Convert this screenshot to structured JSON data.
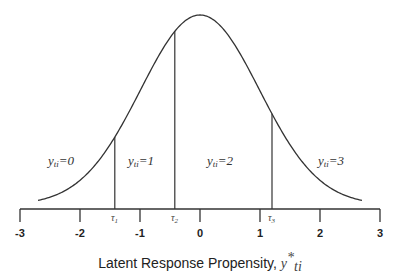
{
  "chart_data": {
    "type": "line",
    "title": "",
    "xlabel": "Latent Response Propensity, y*ti",
    "ylabel": "",
    "xlim": [
      -3,
      3
    ],
    "x_ticks": [
      -3,
      -2,
      -1,
      0,
      1,
      2,
      3
    ],
    "x_tick_labels": [
      "-3",
      "-2",
      "-1",
      "0",
      "1",
      "2",
      "3"
    ],
    "grid": false,
    "series": [
      {
        "name": "density",
        "distribution": "normal",
        "mean": 0,
        "sd": 1
      }
    ],
    "thresholds": [
      {
        "label": "τ1",
        "x": -1.42
      },
      {
        "label": "τ2",
        "x": -0.42
      },
      {
        "label": "τ3",
        "x": 1.2
      }
    ],
    "regions": [
      {
        "label": "yti=0",
        "x_center": -2.3
      },
      {
        "label": "yti=1",
        "x_center": -0.9
      },
      {
        "label": "yti=2",
        "x_center": 0.35
      },
      {
        "label": "yti=3",
        "x_center": 2.15
      }
    ]
  },
  "labels": {
    "x_axis_main": "Latent Response Propensity, ",
    "x_axis_var": "y",
    "x_axis_sup": "*",
    "x_axis_sub": "ti",
    "regions": [
      {
        "var": "y",
        "sub": "ti",
        "eq": "=0"
      },
      {
        "var": "y",
        "sub": "ti",
        "eq": "=1"
      },
      {
        "var": "y",
        "sub": "ti",
        "eq": "=2"
      },
      {
        "var": "y",
        "sub": "ti",
        "eq": "=3"
      }
    ],
    "taus": [
      {
        "sym": "τ",
        "sub": "1"
      },
      {
        "sym": "τ",
        "sub": "2"
      },
      {
        "sym": "τ",
        "sub": "3"
      }
    ],
    "ticks": [
      "-3",
      "-2",
      "-1",
      "0",
      "1",
      "2",
      "3"
    ]
  },
  "colors": {
    "line": "#333333",
    "text": "#222222"
  }
}
